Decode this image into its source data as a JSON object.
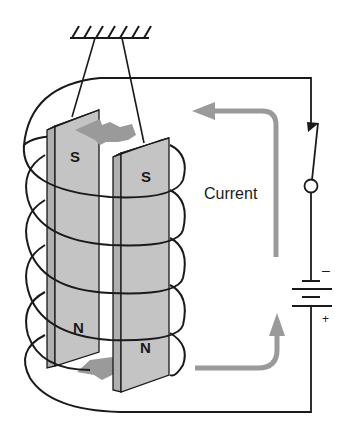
{
  "diagram": {
    "labels": {
      "current": "Current",
      "left_magnet_top_pole": "S",
      "right_magnet_top_pole": "S",
      "left_magnet_bottom_pole": "N",
      "right_magnet_bottom_pole": "N",
      "battery_negative": "–",
      "battery_positive": "+"
    },
    "components": [
      {
        "id": "support",
        "name": "ceiling support with hanging threads"
      },
      {
        "id": "left-strip",
        "name": "left iron strip",
        "top_pole": "S",
        "bottom_pole": "N"
      },
      {
        "id": "right-strip",
        "name": "right iron strip",
        "top_pole": "S",
        "bottom_pole": "N"
      },
      {
        "id": "coil",
        "name": "solenoid coil",
        "turns": 5
      },
      {
        "id": "switch",
        "name": "switch (closed)"
      },
      {
        "id": "battery",
        "name": "battery",
        "terminals": [
          "–",
          "+"
        ]
      }
    ],
    "colors": {
      "line": "#1a1a1a",
      "strip_fill": "#c4c4c4",
      "strip_edge": "#a8a8a8",
      "arrow": "#9a9a9a",
      "background": "#ffffff"
    }
  }
}
